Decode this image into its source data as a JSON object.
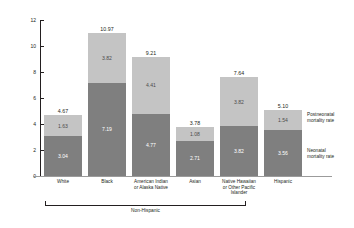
{
  "chart_data": {
    "type": "bar",
    "subtype": "stacked-bar",
    "title": "",
    "xlabel": "",
    "ylabel": "Infant deaths per 1,000 live births",
    "ylim": [
      0,
      12
    ],
    "yticks": [
      0,
      2,
      4,
      6,
      8,
      10,
      12
    ],
    "ytick_labels": [
      "0",
      "2",
      "4",
      "6",
      "8",
      "10",
      "12"
    ],
    "grid": false,
    "legend_position": "right",
    "categories": [
      "White",
      "Black",
      "American Indian or Alaska Native",
      "Asian",
      "Native Hawaiian or Other Pacific Islander",
      "Hispanic"
    ],
    "series": [
      {
        "name": "Neonatal mortality rate",
        "color": "#7f7f7f",
        "values": [
          3.04,
          7.19,
          4.77,
          2.71,
          3.82,
          3.56
        ]
      },
      {
        "name": "Postneonatal mortality rate",
        "color": "#c4c4c4",
        "values": [
          1.63,
          3.82,
          4.41,
          1.08,
          3.82,
          1.54
        ]
      }
    ],
    "totals": [
      4.67,
      10.97,
      9.21,
      3.78,
      7.64,
      5.1
    ],
    "annotations": [
      {
        "text": "Non-Hispanic",
        "spans_categories": [
          "White",
          "Black",
          "American Indian or Alaska Native",
          "Asian",
          "Native Hawaiian or Other Pacific Islander"
        ]
      }
    ]
  },
  "axis": {
    "y_title": "Infant deaths per 1,000 live births",
    "ticks": [
      {
        "label": "12",
        "value": 12
      },
      {
        "label": "10",
        "value": 10
      },
      {
        "label": "8",
        "value": 8
      },
      {
        "label": "6",
        "value": 6
      },
      {
        "label": "4",
        "value": 4
      },
      {
        "label": "2",
        "value": 2
      },
      {
        "label": "0",
        "value": 0
      }
    ]
  },
  "bars": [
    {
      "category": "White",
      "category_lines": [
        "White"
      ],
      "total": "4.67",
      "postneonatal": "1.63",
      "neonatal": "3.04"
    },
    {
      "category": "Black",
      "category_lines": [
        "Black"
      ],
      "total": "10.97",
      "postneonatal": "3.82",
      "neonatal": "7.19"
    },
    {
      "category": "American Indian or Alaska Native",
      "category_lines": [
        "American Indian",
        "or Alaska Native"
      ],
      "total": "9.21",
      "postneonatal": "4.41",
      "neonatal": "4.77"
    },
    {
      "category": "Asian",
      "category_lines": [
        "Asian"
      ],
      "total": "3.78",
      "postneonatal": "1.08",
      "neonatal": "2.71"
    },
    {
      "category": "Native Hawaiian or Other Pacific Islander",
      "category_lines": [
        "Native Hawaiian",
        "or Other Pacific",
        "Islander"
      ],
      "total": "7.64",
      "postneonatal": "3.82",
      "neonatal": "3.82"
    },
    {
      "category": "Hispanic",
      "category_lines": [
        "Hispanic"
      ],
      "total": "5.10",
      "postneonatal": "1.54",
      "neonatal": "3.56"
    }
  ],
  "bracket": {
    "label": "Non-Hispanic"
  },
  "legend": {
    "items": [
      {
        "label_lines": [
          "Postneonatal",
          "mortality rate"
        ],
        "color": "#c4c4c4"
      },
      {
        "label_lines": [
          "Neonatal",
          "mortality rate"
        ],
        "color": "#7f7f7f"
      }
    ]
  },
  "colors": {
    "postneonatal": "#c4c4c4",
    "neonatal": "#7f7f7f",
    "axis": "#231f20",
    "background": "#ffffff"
  }
}
